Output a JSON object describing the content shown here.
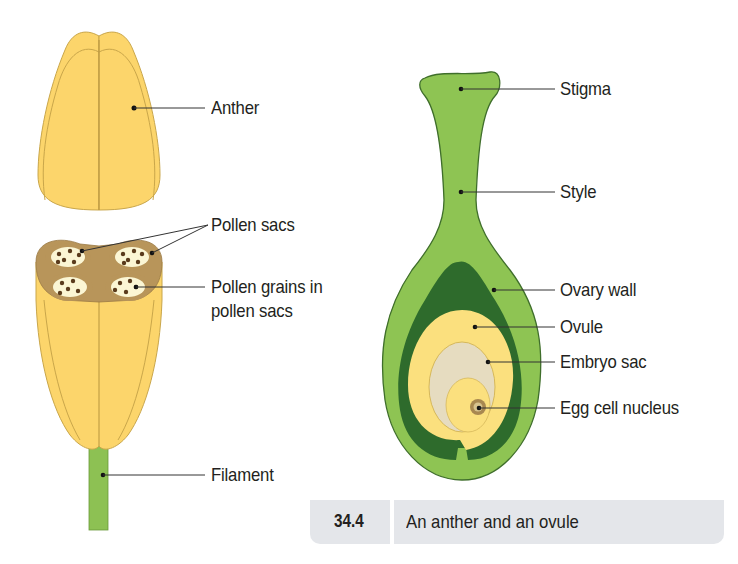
{
  "figure": {
    "number": "34.4",
    "caption": "An anther and an ovule"
  },
  "anther_diagram": {
    "labels": {
      "anther": "Anther",
      "pollen_sacs": "Pollen sacs",
      "pollen_grains_line1": "Pollen grains in",
      "pollen_grains_line2": "pollen sacs",
      "filament": "Filament"
    }
  },
  "ovule_diagram": {
    "labels": {
      "stigma": "Stigma",
      "style": "Style",
      "ovary_wall": "Ovary wall",
      "ovule": "Ovule",
      "embryo_sac": "Embryo sac",
      "egg_cell_nucleus": "Egg cell nucleus"
    }
  },
  "colors": {
    "anther_yellow": "#fcd56b",
    "anther_outline": "#c9a64a",
    "pollen_sac_brown": "#b8955a",
    "pollen_sac_inner": "#fbf6d4",
    "pollen_grain": "#5a3b1c",
    "filament_green": "#8dc153",
    "carpel_green": "#8ec453",
    "ovary_dark_green": "#2e6b2c",
    "ovule_yellow": "#fbe07e",
    "embryo_sac_beige": "#e6dcc0",
    "caption_bg": "#e4e6ea",
    "text": "#231f20"
  }
}
